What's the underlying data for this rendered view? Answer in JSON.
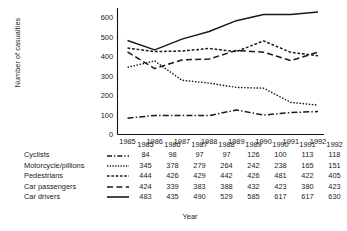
{
  "chart_data": {
    "type": "line",
    "title": "",
    "xlabel": "Year",
    "ylabel": "Number of casualties",
    "categories": [
      "1985",
      "1986",
      "1987",
      "1988",
      "1989",
      "1990",
      "1991",
      "1992"
    ],
    "x": [
      1985,
      1986,
      1987,
      1988,
      1989,
      1990,
      1991,
      1992
    ],
    "ylim": [
      0,
      650
    ],
    "yticks": [
      0,
      100,
      200,
      300,
      400,
      500,
      600
    ],
    "ytick_labels": [
      "0",
      "100",
      "200",
      "300",
      "400",
      "500",
      "600"
    ],
    "grid": false,
    "legend_position": "table-below",
    "series": [
      {
        "name": "Cyclists",
        "line_style": "dash-dot",
        "values": [
          84,
          98,
          97,
          97,
          126,
          100,
          113,
          118
        ]
      },
      {
        "name": "Motorcycle/pillions",
        "line_style": "dotted",
        "values": [
          345,
          378,
          279,
          264,
          242,
          238,
          165,
          151
        ]
      },
      {
        "name": "Pedestrians",
        "line_style": "dashed-short",
        "values": [
          444,
          426,
          429,
          442,
          426,
          481,
          422,
          405
        ]
      },
      {
        "name": "Car passengers",
        "line_style": "dashed-long",
        "values": [
          424,
          339,
          383,
          388,
          432,
          423,
          380,
          423
        ]
      },
      {
        "name": "Car drivers",
        "line_style": "solid",
        "values": [
          483,
          435,
          490,
          529,
          585,
          617,
          617,
          630
        ]
      }
    ]
  },
  "axis": {
    "y_title": "Number of casualties",
    "x_title": "Year",
    "y_ticks": [
      "600",
      "500",
      "400",
      "300",
      "200",
      "100",
      "0"
    ],
    "x_ticks": [
      "1985",
      "1986",
      "1987",
      "1988",
      "1989",
      "1990",
      "1991",
      "1992"
    ]
  },
  "table": {
    "header": [
      "",
      "",
      "1985",
      "1986",
      "1987",
      "1988",
      "1989",
      "1990",
      "1991",
      "1992"
    ],
    "rows": [
      {
        "label": "Cyclists",
        "key_icon": "dash-dot-line-icon",
        "values": [
          "84",
          "98",
          "97",
          "97",
          "126",
          "100",
          "113",
          "118"
        ]
      },
      {
        "label": "Motorcycle/pillions",
        "key_icon": "dotted-line-icon",
        "values": [
          "345",
          "378",
          "279",
          "264",
          "242",
          "238",
          "165",
          "151"
        ]
      },
      {
        "label": "Pedestrians",
        "key_icon": "short-dashed-line-icon",
        "values": [
          "444",
          "426",
          "429",
          "442",
          "426",
          "481",
          "422",
          "405"
        ]
      },
      {
        "label": "Car passengers",
        "key_icon": "long-dashed-line-icon",
        "values": [
          "424",
          "339",
          "383",
          "388",
          "432",
          "423",
          "380",
          "423"
        ]
      },
      {
        "label": "Car drivers",
        "key_icon": "solid-line-icon",
        "values": [
          "483",
          "435",
          "490",
          "529",
          "585",
          "617",
          "617",
          "630"
        ]
      }
    ],
    "footer_label": "Year"
  },
  "colors": {
    "ink": "#1a1a1a",
    "background": "#ffffff",
    "axis": "#111111"
  }
}
